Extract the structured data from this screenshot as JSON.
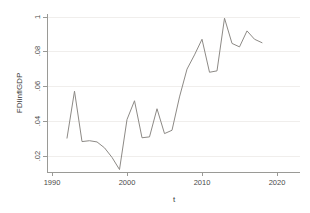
{
  "chart_data": {
    "type": "line",
    "title": "",
    "xlabel": "t",
    "ylabel": "FDIinflGDP",
    "xlim": [
      1990,
      2020
    ],
    "ylim": [
      0.008,
      0.1
    ],
    "grid": true,
    "legend": null,
    "xticks": [
      "1990",
      "2000",
      "2010",
      "2020"
    ],
    "xtick_values": [
      1990,
      2000,
      2010,
      2020
    ],
    "yticks": [
      ".02",
      ".04",
      ".06",
      ".08",
      "1"
    ],
    "ytick_values": [
      0.02,
      0.04,
      0.06,
      0.08,
      0.1
    ],
    "series": [
      {
        "name": "FDIinflGDP",
        "color": "#8d8a86",
        "x": [
          1992,
          1993,
          1994,
          1995,
          1996,
          1997,
          1998,
          1999,
          2000,
          2001,
          2002,
          2003,
          2004,
          2005,
          2006,
          2007,
          2008,
          2009,
          2010,
          2011,
          2012,
          2013,
          2014,
          2015,
          2016,
          2017,
          2018
        ],
        "values": [
          0.0303,
          0.0573,
          0.0283,
          0.0288,
          0.0281,
          0.0247,
          0.0192,
          0.0122,
          0.041,
          0.0518,
          0.0305,
          0.031,
          0.0472,
          0.0329,
          0.0348,
          0.054,
          0.07,
          0.0782,
          0.0872,
          0.0682,
          0.069,
          0.0993,
          0.0848,
          0.0828,
          0.092,
          0.0872,
          0.0852
        ]
      }
    ]
  },
  "axes": {
    "y_title": "FDIinflGDP",
    "x_title": "t"
  }
}
